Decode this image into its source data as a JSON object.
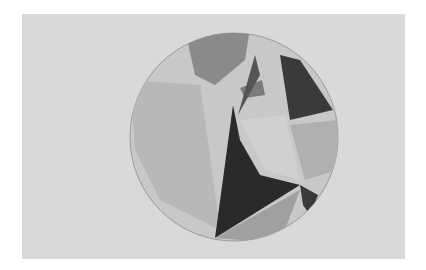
{
  "image": {
    "subject": "pencil drawing of a circle filled with shaded geometric regions",
    "colors": {
      "page": "#ffffff",
      "paper": "#d9d9d9",
      "light_shade": "#c4c4c4",
      "mid_shade": "#a9a9a9",
      "dark_shade": "#6f6f6f",
      "darkest": "#1f1f1f"
    }
  }
}
